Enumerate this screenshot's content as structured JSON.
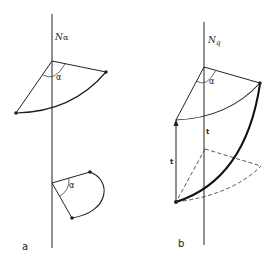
{
  "panel_a": {
    "label": "a",
    "axis_label_main": "N",
    "axis_label_sub": "α",
    "upper_angle_label": "α",
    "lower_angle_label": "α"
  },
  "panel_b": {
    "label": "b",
    "axis_label_main": "N",
    "axis_label_sub": "q",
    "angle_label": "α",
    "vector_label_left": "t",
    "vector_label_mid": "t"
  },
  "colors": {
    "stroke": "#222222",
    "axis": "#555555",
    "background": "#ffffff"
  }
}
